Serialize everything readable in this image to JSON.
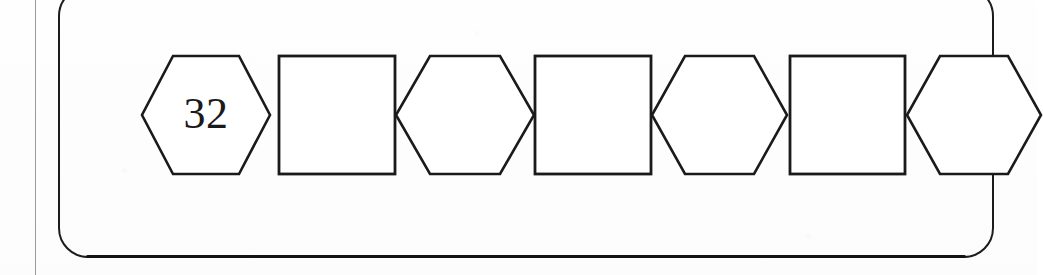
{
  "worksheet": {
    "type": "number-sequence-shape-strip",
    "description": "Row of alternating hexagon and square outline shapes inside a rounded rectangle; first hexagon is filled in with a number.",
    "margin_rule": "page-margin-line",
    "container": {
      "shape": "rounded-rectangle",
      "border_color": "#1c1c1c",
      "fill_color": "#ffffff"
    },
    "strip": {
      "cells": [
        {
          "index": 0,
          "shape": "hexagon",
          "value": "32",
          "filled": true
        },
        {
          "index": 1,
          "shape": "square",
          "value": "",
          "filled": false
        },
        {
          "index": 2,
          "shape": "hexagon",
          "value": "",
          "filled": false
        },
        {
          "index": 3,
          "shape": "square",
          "value": "",
          "filled": false
        },
        {
          "index": 4,
          "shape": "hexagon",
          "value": "",
          "filled": false
        },
        {
          "index": 5,
          "shape": "square",
          "value": "",
          "filled": false
        },
        {
          "index": 6,
          "shape": "hexagon",
          "value": "",
          "filled": false
        }
      ]
    },
    "colors": {
      "ink": "#1a1a1a",
      "paper": "#fdfdfd",
      "margin_line": "#9a9a9a"
    }
  }
}
